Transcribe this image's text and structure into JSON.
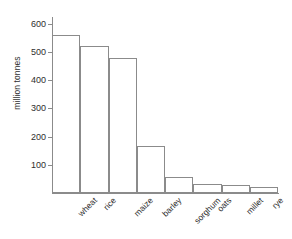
{
  "chart_data": {
    "type": "bar",
    "title": "",
    "xlabel": "",
    "ylabel": "million tonnes",
    "categories": [
      "wheat",
      "rice",
      "maize",
      "barley",
      "sorghum",
      "oats",
      "millet",
      "rye"
    ],
    "values": [
      560,
      520,
      478,
      168,
      58,
      33,
      27,
      22
    ],
    "ylim": [
      0,
      620
    ],
    "yticks": [
      100,
      200,
      300,
      400,
      500,
      600
    ],
    "ytick_labels": [
      "100",
      "200",
      "300",
      "400",
      "500",
      "600"
    ],
    "grid": false,
    "legend": null,
    "series": [
      {
        "name": "production",
        "values": [
          560,
          520,
          478,
          168,
          58,
          33,
          27,
          22
        ]
      }
    ],
    "style": {
      "bar_fill": "#ffffff",
      "bar_edge": "#8b8b8b",
      "axis_color": "#8b8b8b",
      "text_color": "#2e2e2e",
      "background": "#ffffff"
    }
  }
}
